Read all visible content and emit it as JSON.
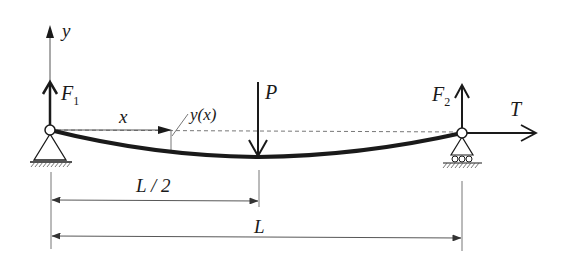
{
  "diagram": {
    "type": "simply-supported beam with axial tension and midspan point load",
    "labels": {
      "y_axis": "y",
      "x_axis": "x",
      "deflection": "y(x)",
      "left_reaction": "F",
      "left_reaction_sub": "1",
      "right_reaction": "F",
      "right_reaction_sub": "2",
      "point_load": "P",
      "tension": "T",
      "half_span": "L / 2",
      "span": "L"
    },
    "elements": [
      {
        "id": "left-support",
        "kind": "pinned support"
      },
      {
        "id": "right-support",
        "kind": "roller support"
      },
      {
        "id": "beam",
        "kind": "deflected beam curve"
      },
      {
        "id": "point-load",
        "kind": "downward arrow at L/2"
      },
      {
        "id": "left-reaction",
        "kind": "upward arrow"
      },
      {
        "id": "right-reaction",
        "kind": "upward arrow"
      },
      {
        "id": "tension",
        "kind": "rightward arrow"
      }
    ],
    "colors": {
      "ink": "#1a1a1a",
      "dim": "#444444",
      "dashed": "#777777"
    }
  }
}
